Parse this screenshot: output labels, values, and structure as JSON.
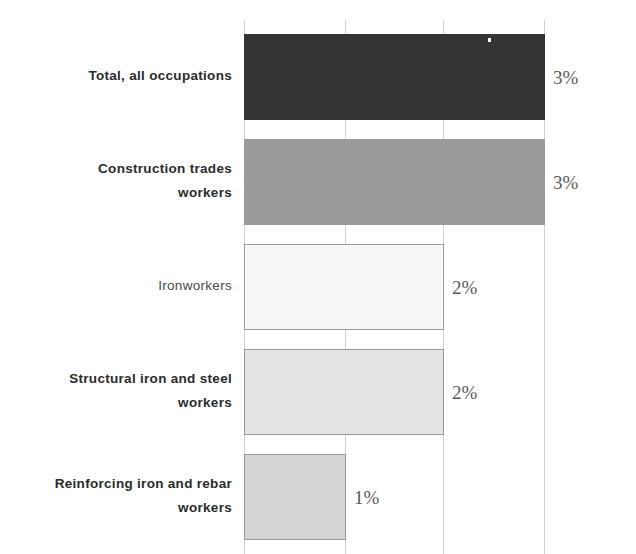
{
  "chart_data": {
    "type": "bar",
    "orientation": "horizontal",
    "title": "",
    "title_note": "clipped at top edge of screenshot, not legible",
    "xlabel": "",
    "ylabel": "",
    "grid": true,
    "gridlines_at": [
      0,
      1,
      2,
      3
    ],
    "xlim": [
      0,
      3
    ],
    "legend": "none",
    "categories": [
      "Total, all occupations",
      "Construction trades workers",
      "Ironworkers",
      "Structural iron and steel workers",
      "Reinforcing iron and rebar workers"
    ],
    "values": [
      3,
      3,
      2,
      2,
      1
    ],
    "data_labels": [
      "3%",
      "3%",
      "2%",
      "2%",
      "1%"
    ],
    "bar_colors": [
      "#343434",
      "#9a9a9a",
      "#f7f7f7",
      "#e4e4e4",
      "#d4d4d4"
    ]
  },
  "title": {
    "text": ""
  },
  "rows": [
    {
      "label_line1": "Total, all occupations",
      "label_line2": "",
      "value": "3%",
      "bold": true
    },
    {
      "label_line1": "Construction trades",
      "label_line2": "workers",
      "value": "3%",
      "bold": true
    },
    {
      "label_line1": "Ironworkers",
      "label_line2": "",
      "value": "2%",
      "bold": false
    },
    {
      "label_line1": "Structural iron and steel",
      "label_line2": "workers",
      "value": "2%",
      "bold": true
    },
    {
      "label_line1": "Reinforcing iron and rebar",
      "label_line2": "workers",
      "value": "1%",
      "bold": true
    }
  ]
}
